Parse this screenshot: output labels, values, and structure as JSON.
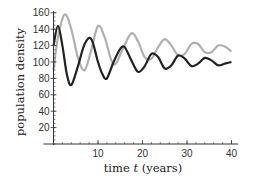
{
  "chart_data": {
    "type": "line",
    "title": "",
    "xlabel": "time t (years)",
    "ylabel": "population density",
    "xlim": [
      0,
      41
    ],
    "ylim": [
      0,
      165
    ],
    "xticks": [
      10,
      20,
      30,
      40
    ],
    "yticks": [
      20,
      40,
      60,
      80,
      100,
      120,
      140,
      160
    ],
    "grid": false,
    "legend": null,
    "series": [
      {
        "name": "gray curve",
        "color": "#b0b0b0",
        "x": [
          0,
          1,
          2.5,
          4,
          5.5,
          7,
          8.5,
          10,
          11.5,
          13,
          14,
          15.5,
          17.5,
          19,
          20.5,
          22,
          23.5,
          25,
          26.5,
          28,
          29.5,
          31,
          32.5,
          34,
          35.5,
          37,
          38.5,
          40
        ],
        "values": [
          90,
          130,
          158,
          140,
          105,
          90,
          115,
          144,
          130,
          102,
          98,
          115,
          135,
          125,
          106,
          104,
          118,
          128,
          120,
          108,
          110,
          122,
          122,
          112,
          112,
          120,
          119,
          113
        ]
      },
      {
        "name": "black curve",
        "color": "#222222",
        "x": [
          0,
          1,
          2,
          3,
          4,
          5.5,
          7,
          8.5,
          10,
          11,
          12,
          13.5,
          15,
          16,
          17.5,
          19,
          20.5,
          22,
          23.5,
          25,
          26.5,
          28,
          29.5,
          31,
          32.5,
          34,
          35.5,
          37,
          38.5,
          40
        ],
        "values": [
          120,
          144,
          120,
          85,
          72,
          95,
          122,
          128,
          100,
          85,
          80,
          100,
          116,
          118,
          102,
          88,
          95,
          110,
          106,
          92,
          96,
          108,
          104,
          95,
          98,
          105,
          102,
          96,
          98,
          100
        ]
      }
    ]
  },
  "axes": {
    "xlabel_prefix": "time ",
    "xlabel_var": "t",
    "xlabel_suffix": " (years)",
    "ylabel": "population density"
  }
}
